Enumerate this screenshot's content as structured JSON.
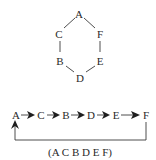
{
  "hexagon": {
    "nodes": [
      {
        "id": "A",
        "label": "A",
        "x": 79,
        "y": 14
      },
      {
        "id": "C",
        "label": "C",
        "x": 59,
        "y": 34
      },
      {
        "id": "F",
        "label": "F",
        "x": 99,
        "y": 34
      },
      {
        "id": "B",
        "label": "B",
        "x": 61,
        "y": 61
      },
      {
        "id": "E",
        "label": "E",
        "x": 99,
        "y": 61
      },
      {
        "id": "D",
        "label": "D",
        "x": 80,
        "y": 78
      }
    ],
    "edges": [
      [
        "A",
        "C"
      ],
      [
        "A",
        "F"
      ],
      [
        "C",
        "B"
      ],
      [
        "F",
        "E"
      ],
      [
        "B",
        "D"
      ],
      [
        "E",
        "D"
      ]
    ]
  },
  "chain": {
    "nodes": [
      {
        "id": "A",
        "label": "A"
      },
      {
        "id": "C",
        "label": "C"
      },
      {
        "id": "B",
        "label": "B"
      },
      {
        "id": "D",
        "label": "D"
      },
      {
        "id": "E",
        "label": "E"
      },
      {
        "id": "F",
        "label": "F"
      }
    ],
    "feedback": {
      "from": "F",
      "to": "A"
    }
  },
  "caption": "(A C B D E F)",
  "colors": {
    "text": "#2a2a2a",
    "line": "#3a3a3a",
    "arrow": "#1e1e1e"
  }
}
